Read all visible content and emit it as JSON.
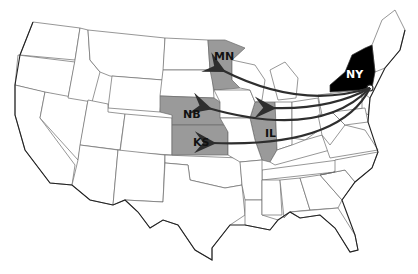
{
  "map": {
    "title": "",
    "origin_state": {
      "abbr": "NY",
      "color": "#000000"
    },
    "destination_states": [
      {
        "abbr": "MN",
        "color": "#9a9a9a"
      },
      {
        "abbr": "NB",
        "color": "#9a9a9a"
      },
      {
        "abbr": "IL",
        "color": "#9a9a9a"
      },
      {
        "abbr": "KS",
        "color": "#9a9a9a"
      }
    ],
    "arrows": [
      {
        "from": "NY",
        "to": "MN"
      },
      {
        "from": "NY",
        "to": "IL"
      },
      {
        "from": "NY",
        "to": "NB"
      },
      {
        "from": "NY",
        "to": "KS"
      }
    ],
    "arrow_color": "#2e2e2e",
    "background": "#ffffff"
  }
}
